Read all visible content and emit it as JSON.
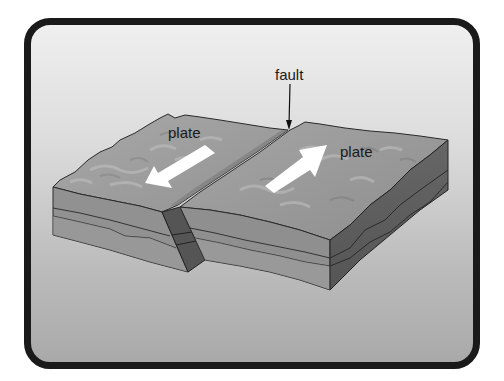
{
  "diagram": {
    "type": "strike-slip fault block diagram",
    "labels": {
      "fault": "fault",
      "plate_left": "plate",
      "plate_right": "plate"
    },
    "arrows": {
      "left_plate_direction": "toward viewer (down-left)",
      "right_plate_direction": "away from viewer (up-right)"
    },
    "colors": {
      "frame_border": "#1a1a1a",
      "background_top": "#efefef",
      "background_bottom": "#a9a9a9",
      "surface": "#9e9e9e",
      "front_face": "#8f8f8f",
      "side_face": "#5e5e5e",
      "fault_slab": "#555555",
      "arrow": "#ffffff"
    }
  }
}
